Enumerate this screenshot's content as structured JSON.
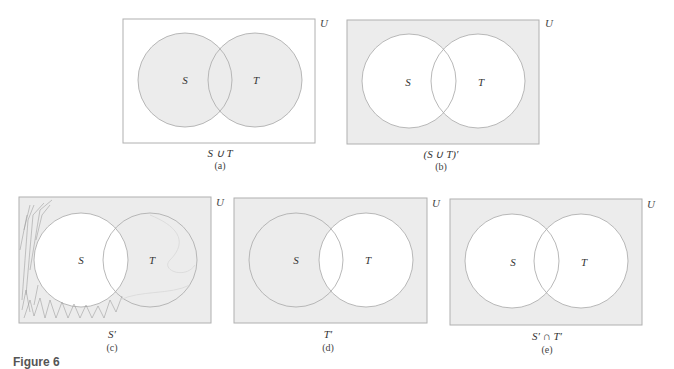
{
  "figure": {
    "label": "Figure 6",
    "shade_color": "#ececec",
    "line_color": "#b0b0b0",
    "scribble_color": "#9a9a9a",
    "panels": [
      {
        "id": "a",
        "caption": "S ∪ T",
        "sub": "(a)",
        "universe_label": "U",
        "set_labels": [
          "S",
          "T"
        ],
        "shaded": "S union T",
        "rect": [
          123,
          19,
          192,
          124
        ],
        "circles": [
          [
            185,
            80,
            47
          ],
          [
            255,
            80,
            47
          ]
        ],
        "caption_x": 220,
        "caption_y": 147,
        "sub_y": 160
      },
      {
        "id": "b",
        "caption": "(S ∪ T)′",
        "sub": "(b)",
        "universe_label": "U",
        "set_labels": [
          "S",
          "T"
        ],
        "shaded": "complement of S union T",
        "rect": [
          347,
          20,
          192,
          124
        ],
        "circles": [
          [
            409,
            81,
            47
          ],
          [
            478,
            81,
            47
          ]
        ],
        "caption_x": 441,
        "caption_y": 148,
        "sub_y": 161
      },
      {
        "id": "c",
        "caption": "S′",
        "sub": "(c)",
        "universe_label": "U",
        "set_labels": [
          "S",
          "T"
        ],
        "shaded": "complement of S",
        "rect": [
          19,
          197,
          192,
          126
        ],
        "circles": [
          [
            81,
            260,
            47
          ],
          [
            150,
            260,
            47
          ]
        ],
        "caption_x": 112,
        "caption_y": 328,
        "sub_y": 342
      },
      {
        "id": "d",
        "caption": "T′",
        "sub": "(d)",
        "universe_label": "U",
        "set_labels": [
          "S",
          "T"
        ],
        "shaded": "complement of T",
        "rect": [
          234,
          198,
          193,
          125
        ],
        "circles": [
          [
            296,
            260,
            47
          ],
          [
            366,
            260,
            47
          ]
        ],
        "caption_x": 328,
        "caption_y": 328,
        "sub_y": 342
      },
      {
        "id": "e",
        "caption": "S′ ∩ T′",
        "sub": "(e)",
        "universe_label": "U",
        "set_labels": [
          "S",
          "T"
        ],
        "shaded": "complement of S intersect complement of T",
        "rect": [
          450,
          199,
          192,
          126
        ],
        "circles": [
          [
            512,
            261,
            47
          ],
          [
            581,
            261,
            47
          ]
        ],
        "caption_x": 547,
        "caption_y": 330,
        "sub_y": 344
      }
    ]
  }
}
